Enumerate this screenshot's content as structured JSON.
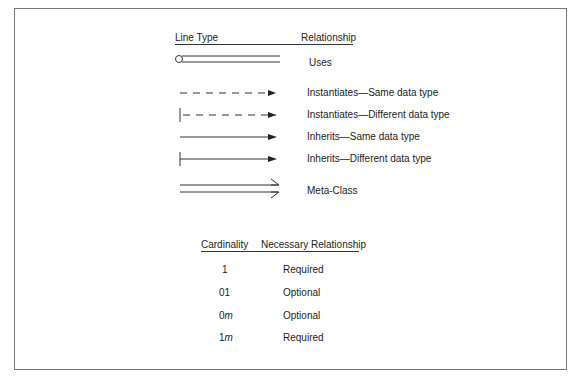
{
  "legend": {
    "headers": {
      "line_type": "Line Type",
      "relationship": "Relationship"
    },
    "rows": [
      {
        "line_style": "double-line-with-circle",
        "icon": "uses-line-icon",
        "label": "Uses"
      },
      {
        "line_style": "dashed-arrow",
        "icon": "dashed-arrow-icon",
        "label": "Instantiates—Same data type"
      },
      {
        "line_style": "dashed-arrow-with-tick",
        "icon": "dashed-arrow-tick-icon",
        "label": "Instantiates—Different data type"
      },
      {
        "line_style": "solid-arrow",
        "icon": "solid-arrow-icon",
        "label": "Inherits—Same data type"
      },
      {
        "line_style": "solid-arrow-with-tick",
        "icon": "solid-arrow-tick-icon",
        "label": "Inherits—Different data type"
      },
      {
        "line_style": "double-open-arrow",
        "icon": "double-open-arrow-icon",
        "label": "Meta-Class"
      }
    ]
  },
  "cardinality": {
    "headers": {
      "cardinality": "Cardinality",
      "necessary_relationship": "Necessary Relationship"
    },
    "rows": [
      {
        "value": "1",
        "value_prefix": "1",
        "value_italic": "",
        "relationship": "Required"
      },
      {
        "value": "01",
        "value_prefix": "01",
        "value_italic": "",
        "relationship": "Optional"
      },
      {
        "value": "0m",
        "value_prefix": "0",
        "value_italic": "m",
        "relationship": "Optional"
      },
      {
        "value": "1m",
        "value_prefix": "1",
        "value_italic": "m",
        "relationship": "Required"
      }
    ]
  },
  "colors": {
    "line": "#333333",
    "frame": "#777777",
    "text": "#222222"
  }
}
